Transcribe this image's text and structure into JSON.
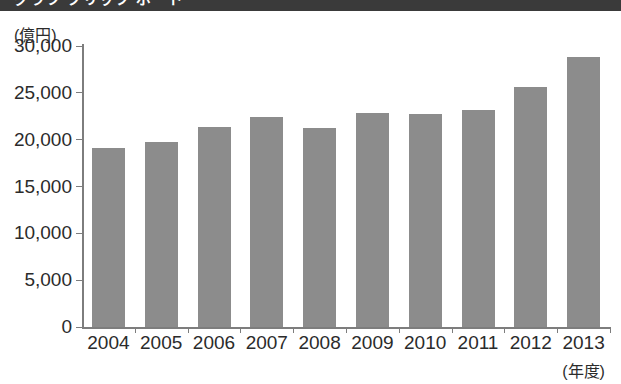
{
  "header": {
    "band_text": "グラフ クリップ ボード",
    "band_color": "#3a3a3a"
  },
  "chart_data": {
    "type": "bar",
    "title": "",
    "subtitle": "",
    "xlabel": "(年度)",
    "ylabel": "(億円)",
    "unit_label": "(億円)",
    "categories": [
      "2004",
      "2005",
      "2006",
      "2007",
      "2008",
      "2009",
      "2010",
      "2011",
      "2012",
      "2013"
    ],
    "values": [
      19100,
      19700,
      21400,
      22400,
      21300,
      22900,
      22700,
      23200,
      25600,
      28800
    ],
    "series": [
      {
        "name": "金額",
        "values": [
          19100,
          19700,
          21400,
          22400,
          21300,
          22900,
          22700,
          23200,
          25600,
          28800
        ]
      }
    ],
    "ylim": [
      0,
      30000
    ],
    "ytick_values": [
      0,
      5000,
      10000,
      15000,
      20000,
      25000,
      30000
    ],
    "ytick_labels": [
      "0",
      "5,000",
      "10,000",
      "15,000",
      "20,000",
      "25,000",
      "30,000"
    ],
    "grid": false,
    "legend": false,
    "legend_position": "none",
    "bar_color": "#8c8c8c",
    "axis_color": "#7d7d7d",
    "text_color": "#2b2b2b"
  }
}
